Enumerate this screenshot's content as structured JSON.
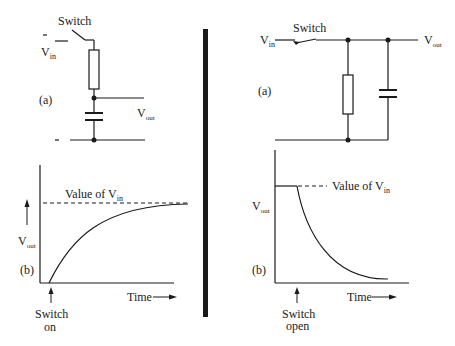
{
  "left": {
    "circuit": {
      "switch_label": "Switch",
      "vin_label": "V",
      "vin_sub": "in",
      "vout_label": "V",
      "vout_sub": "out",
      "panel_label": "(a)"
    },
    "graph": {
      "reference_label": "Value of V",
      "reference_sub": "in",
      "y_label": "V",
      "y_sub": "out",
      "panel_label": "(b)",
      "x_label": "Time",
      "event_label_1": "Switch",
      "event_label_2": "on"
    }
  },
  "right": {
    "circuit": {
      "switch_label": "Switch",
      "vin_label": "V",
      "vin_sub": "in",
      "vout_label": "V",
      "vout_sub": "out",
      "panel_label": "(a)"
    },
    "graph": {
      "reference_label": "Value of V",
      "reference_sub": "in",
      "y_label": "V",
      "y_sub": "out",
      "panel_label": "(b)",
      "x_label": "Time",
      "event_label_1": "Switch",
      "event_label_2": "open"
    }
  },
  "colors": {
    "ink": "#1a1a1a",
    "background": "#ffffff"
  }
}
